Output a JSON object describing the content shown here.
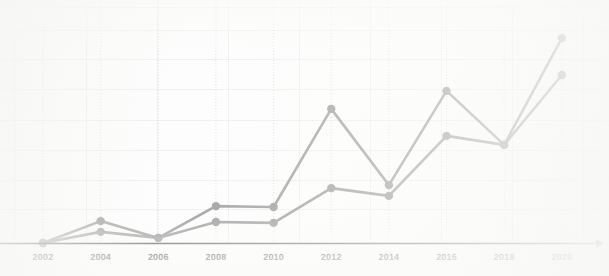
{
  "chart_data": {
    "type": "line",
    "title": "",
    "subtitle": "",
    "xlabel": "",
    "ylabel": "",
    "grid": true,
    "legend_position": "none",
    "categories": [
      "2002",
      "2004",
      "2006",
      "2008",
      "2010",
      "2012",
      "2014",
      "2016",
      "2018",
      "2020"
    ],
    "x_tick_labels": [
      "2002",
      "2004",
      "2006",
      "2008",
      "2010",
      "2012",
      "2014",
      "2016",
      "2018",
      "2020"
    ],
    "y_tick_labels": [],
    "xlim": [
      2002,
      2020
    ],
    "ylim": [
      0,
      7.5
    ],
    "annotations": [],
    "series": [
      {
        "name": "series-1",
        "color": "#8d8d8d",
        "marker": "circle",
        "values": [
          0.0,
          0.73,
          0.17,
          1.23,
          1.2,
          4.47,
          1.93,
          5.07,
          3.27,
          6.83
        ]
      },
      {
        "name": "series-2",
        "color": "#8d8d8d",
        "marker": "circle",
        "values": [
          0.0,
          0.37,
          0.17,
          0.7,
          0.67,
          1.83,
          1.57,
          3.57,
          3.27,
          5.6
        ]
      }
    ]
  },
  "axis": {
    "x_axis_color": "#3a3a3a",
    "x_axis_has_arrow": true,
    "arrow_icon": "arrow-right-icon"
  },
  "style": {
    "background": "#fdfdfd",
    "line_color": "#8d8d8d",
    "marker_color": "#8a8a8a",
    "grid_color": "#ececec",
    "dotted_grid_color": "#d8d8d8",
    "tick_label_color": "#2b2b2b"
  }
}
